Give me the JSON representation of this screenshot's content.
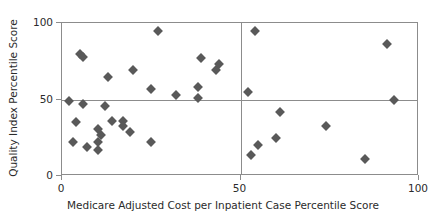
{
  "chart_data": {
    "type": "scatter",
    "title": "",
    "xlabel": "Medicare Adjusted Cost per Inpatient Case Percentile Score",
    "ylabel": "Quality Index Percentile Score",
    "xlim": [
      0,
      100
    ],
    "ylim": [
      0,
      100
    ],
    "xticks": [
      0,
      50,
      100
    ],
    "yticks": [
      0,
      50,
      100
    ],
    "xtick_labels": [
      "0",
      "50",
      "100"
    ],
    "ytick_labels": [
      "0",
      "50",
      "100"
    ],
    "grid": false,
    "legend": null,
    "marker": {
      "shape": "diamond",
      "color": "#595959",
      "size": 7
    },
    "reference_lines": [
      {
        "axis": "y",
        "value": 50,
        "color": "#8c8c8c"
      },
      {
        "axis": "x",
        "value": 50,
        "color": "#8c8c8c"
      }
    ],
    "series": [
      {
        "name": "Hospitals",
        "points": [
          {
            "x": 2,
            "y": 49
          },
          {
            "x": 3,
            "y": 22
          },
          {
            "x": 4,
            "y": 35
          },
          {
            "x": 5,
            "y": 80
          },
          {
            "x": 6,
            "y": 78
          },
          {
            "x": 6,
            "y": 47
          },
          {
            "x": 7,
            "y": 19
          },
          {
            "x": 10,
            "y": 31
          },
          {
            "x": 10,
            "y": 22
          },
          {
            "x": 10,
            "y": 17
          },
          {
            "x": 11,
            "y": 27
          },
          {
            "x": 12,
            "y": 46
          },
          {
            "x": 13,
            "y": 65
          },
          {
            "x": 14,
            "y": 36
          },
          {
            "x": 17,
            "y": 36
          },
          {
            "x": 17,
            "y": 33
          },
          {
            "x": 19,
            "y": 29
          },
          {
            "x": 20,
            "y": 69
          },
          {
            "x": 25,
            "y": 57
          },
          {
            "x": 25,
            "y": 22
          },
          {
            "x": 27,
            "y": 95
          },
          {
            "x": 32,
            "y": 53
          },
          {
            "x": 38,
            "y": 58
          },
          {
            "x": 38,
            "y": 51
          },
          {
            "x": 39,
            "y": 77
          },
          {
            "x": 43,
            "y": 69
          },
          {
            "x": 44,
            "y": 73
          },
          {
            "x": 52,
            "y": 55
          },
          {
            "x": 53,
            "y": 14
          },
          {
            "x": 54,
            "y": 95
          },
          {
            "x": 55,
            "y": 20
          },
          {
            "x": 60,
            "y": 25
          },
          {
            "x": 61,
            "y": 42
          },
          {
            "x": 74,
            "y": 33
          },
          {
            "x": 85,
            "y": 11
          },
          {
            "x": 91,
            "y": 86
          },
          {
            "x": 93,
            "y": 50
          }
        ]
      }
    ]
  }
}
